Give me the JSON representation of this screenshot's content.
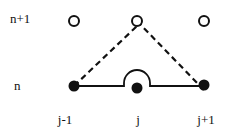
{
  "diagram": {
    "type": "finite-difference-stencil",
    "row_labels": [
      {
        "id": "time-level-n-plus-1",
        "text": "n+1",
        "x": 10,
        "y": 12
      },
      {
        "id": "time-level-n",
        "text": "n",
        "x": 14,
        "y": 79
      }
    ],
    "column_labels": [
      {
        "id": "grid-point-j-minus-1",
        "text": "j-1",
        "x": 62,
        "y": 113
      },
      {
        "id": "grid-point-j",
        "text": "j",
        "x": 137,
        "y": 113
      },
      {
        "id": "grid-point-j-plus-1",
        "text": "j+1",
        "x": 202,
        "y": 113
      }
    ],
    "nodes": [
      {
        "id": "node-j-minus-1-n-plus-1",
        "col": "j-1",
        "row": "n+1",
        "cx": 74,
        "cy": 21,
        "filled": false
      },
      {
        "id": "node-j-n-plus-1",
        "col": "j",
        "row": "n+1",
        "cx": 137,
        "cy": 21,
        "filled": false
      },
      {
        "id": "node-j-plus-1-n-plus-1",
        "col": "j+1",
        "row": "n+1",
        "cx": 204,
        "cy": 21,
        "filled": false
      },
      {
        "id": "node-j-minus-1-n",
        "col": "j-1",
        "row": "n",
        "cx": 74,
        "cy": 86,
        "filled": true
      },
      {
        "id": "node-j-n",
        "col": "j",
        "row": "n",
        "cx": 137,
        "cy": 88,
        "filled": true
      },
      {
        "id": "node-j-plus-1-n",
        "col": "j+1",
        "row": "n",
        "cx": 204,
        "cy": 85,
        "filled": true
      }
    ],
    "edges": [
      {
        "id": "dashed-left",
        "style": "dashed",
        "from": "node-j-minus-1-n",
        "to": "node-j-n-plus-1"
      },
      {
        "id": "dashed-right",
        "style": "dashed",
        "from": "node-j-n-plus-1",
        "to": "node-j-plus-1-n"
      },
      {
        "id": "solid-baseline",
        "style": "solid-with-bump",
        "from": "node-j-minus-1-n",
        "to": "node-j-plus-1-n",
        "bump_over": "node-j-n"
      }
    ],
    "colors": {
      "ink": "#111111",
      "background": "#ffffff"
    }
  }
}
